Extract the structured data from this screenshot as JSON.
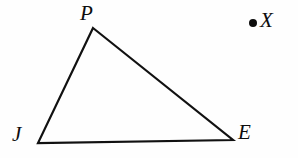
{
  "figure": {
    "type": "geometry-diagram",
    "background_color": "#fefefe",
    "stroke_color": "#111111",
    "stroke_width": 2.2,
    "canvas": {
      "width": 298,
      "height": 158
    },
    "shape": {
      "name": "triangle",
      "vertices": [
        {
          "id": "P",
          "label": "P",
          "x": 93,
          "y": 28
        },
        {
          "id": "E",
          "label": "E",
          "x": 233,
          "y": 140
        },
        {
          "id": "J",
          "label": "J",
          "x": 38,
          "y": 143
        }
      ],
      "edges": [
        {
          "from": "P",
          "to": "E"
        },
        {
          "from": "E",
          "to": "J"
        },
        {
          "from": "J",
          "to": "P"
        }
      ]
    },
    "points": [
      {
        "id": "X",
        "label": "X",
        "x": 253,
        "y": 22,
        "marker": "filled-dot"
      }
    ],
    "labels": {
      "P": "P",
      "J": "J",
      "E": "E",
      "X": "X"
    }
  }
}
